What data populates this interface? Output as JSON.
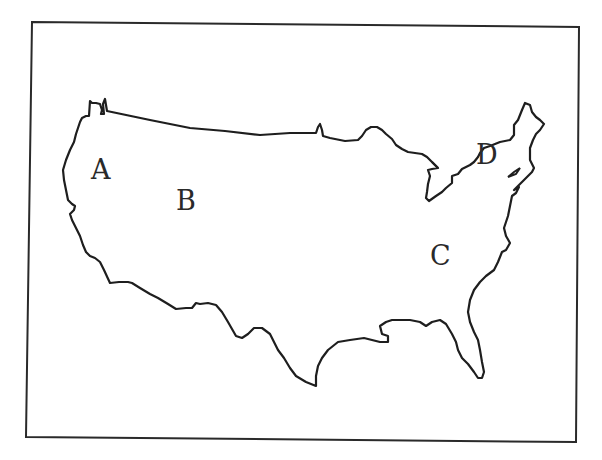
{
  "map": {
    "subject": "Outline map of the contiguous United States",
    "style": "hand-drawn black line on white",
    "colors": {
      "background": "#ffffff",
      "outline": "#1e1e1e",
      "frame": "#2a2a2a",
      "label_text": "#2a2a2a"
    },
    "labels": [
      {
        "id": "A",
        "text": "A",
        "region": "Pacific Northwest"
      },
      {
        "id": "B",
        "text": "B",
        "region": "Interior West"
      },
      {
        "id": "C",
        "text": "C",
        "region": "Southeast"
      },
      {
        "id": "D",
        "text": "D",
        "region": "Northeast"
      }
    ]
  }
}
